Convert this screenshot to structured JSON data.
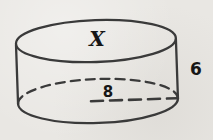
{
  "figure": {
    "type": "cylinder-diagram",
    "labels": {
      "top_face": "X",
      "height": "6",
      "radius": "8"
    },
    "colors": {
      "background": "#e9e7e3",
      "stroke": "#3a3a3a",
      "text": "#161616"
    }
  }
}
